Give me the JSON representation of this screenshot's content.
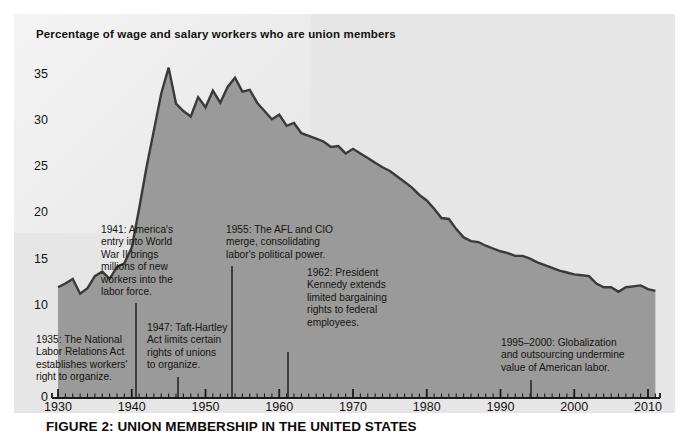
{
  "figure": {
    "panel_title": "Percentage of wage and salary workers who are union members",
    "caption_label": "FIGURE 2:",
    "caption_text": " UNION MEMBERSHIP IN THE UNITED STATES",
    "panel_bg": "#e6e6e6",
    "area_fill": "#9a9a9a",
    "line_color": "#3a3a3a",
    "axis_color": "#1a1a1a",
    "text_color": "#16130f"
  },
  "chart_data": {
    "type": "area",
    "title": "Percentage of wage and salary workers who are union members",
    "xlabel": "",
    "ylabel": "",
    "xlim": [
      1930,
      2011
    ],
    "ylim": [
      0,
      38
    ],
    "grid": false,
    "legend": null,
    "y_ticks": [
      0,
      10,
      15,
      20,
      25,
      30,
      35
    ],
    "y_tick_labels": [
      "0",
      "10",
      "15",
      "20",
      "25",
      "30",
      "35"
    ],
    "x_ticks": [
      1930,
      1940,
      1950,
      1960,
      1970,
      1980,
      1990,
      2000,
      2010
    ],
    "x_tick_labels": [
      "1930",
      "1940",
      "1950",
      "1960",
      "1970",
      "1980",
      "1990",
      "2000",
      "2010"
    ],
    "x_minor_tick_interval": 1,
    "series": [
      {
        "name": "Union membership rate",
        "x": [
          1930,
          1931,
          1932,
          1933,
          1934,
          1935,
          1936,
          1937,
          1938,
          1939,
          1940,
          1941,
          1942,
          1943,
          1944,
          1945,
          1946,
          1947,
          1948,
          1949,
          1950,
          1951,
          1952,
          1953,
          1954,
          1955,
          1956,
          1957,
          1958,
          1959,
          1960,
          1961,
          1962,
          1963,
          1964,
          1965,
          1966,
          1967,
          1968,
          1969,
          1970,
          1971,
          1972,
          1973,
          1974,
          1975,
          1976,
          1977,
          1978,
          1979,
          1980,
          1981,
          1982,
          1983,
          1984,
          1985,
          1986,
          1987,
          1988,
          1989,
          1990,
          1991,
          1992,
          1993,
          1994,
          1995,
          1996,
          1997,
          1998,
          1999,
          2000,
          2001,
          2002,
          2003,
          2004,
          2005,
          2006,
          2007,
          2008,
          2009,
          2010,
          2011
        ],
        "values": [
          12.0,
          12.4,
          12.9,
          11.3,
          11.9,
          13.2,
          13.7,
          12.9,
          14.2,
          14.6,
          16.3,
          20.5,
          25.0,
          29.0,
          33.0,
          35.8,
          31.9,
          31.1,
          30.5,
          32.6,
          31.5,
          33.3,
          32.0,
          33.7,
          34.7,
          33.2,
          33.4,
          32.0,
          31.1,
          30.2,
          30.7,
          29.5,
          29.8,
          28.7,
          28.4,
          28.1,
          27.8,
          27.2,
          27.3,
          26.5,
          27.0,
          26.5,
          26.0,
          25.5,
          25.0,
          24.6,
          24.0,
          23.4,
          22.8,
          22.0,
          21.4,
          20.5,
          19.5,
          19.4,
          18.3,
          17.4,
          17.0,
          16.9,
          16.5,
          16.2,
          15.9,
          15.7,
          15.4,
          15.4,
          15.1,
          14.7,
          14.4,
          14.1,
          13.8,
          13.6,
          13.4,
          13.3,
          13.2,
          12.4,
          12.0,
          12.0,
          11.5,
          12.0,
          12.1,
          12.2,
          11.8,
          11.6
        ]
      }
    ],
    "annotations": [
      {
        "id": "1935",
        "text": "1935: The National\nLabor Relations Act\nestablishes workers'\nright to organize.",
        "x": 36,
        "y": 334,
        "leader_x": null,
        "leader_y_top": null,
        "leader_y_bottom": null
      },
      {
        "id": "1941",
        "text": "1941: America's\nentry into World\nWar II brings\nmillions of new\nworkers into the\nlabor force.",
        "x": 101,
        "y": 224,
        "leader_x": 136,
        "leader_y_top": 303,
        "leader_y_bottom": 398
      },
      {
        "id": "1947",
        "text": "1947: Taft-Hartley\nAct limits certain\nrights of unions\nto organize.",
        "x": 147,
        "y": 322,
        "leader_x": 178,
        "leader_y_top": 377,
        "leader_y_bottom": 398
      },
      {
        "id": "1955",
        "text": "1955: The AFL and CIO\nmerge, consolidating\nlabor's political power.",
        "x": 226,
        "y": 224,
        "leader_x": 232,
        "leader_y_top": 266,
        "leader_y_bottom": 398
      },
      {
        "id": "1962",
        "text": "1962: President\nKennedy extends\nlimited bargaining\nrights to federal\nemployees.",
        "x": 307,
        "y": 267,
        "leader_x": 288,
        "leader_y_top": 352,
        "leader_y_bottom": 398
      },
      {
        "id": "1995-2000",
        "text": "1995–2000: Globalization\nand outsourcing undermine\nvalue of American labor.",
        "x": 501,
        "y": 337,
        "leader_x": 531,
        "leader_y_top": 380,
        "leader_y_bottom": 398
      }
    ]
  }
}
